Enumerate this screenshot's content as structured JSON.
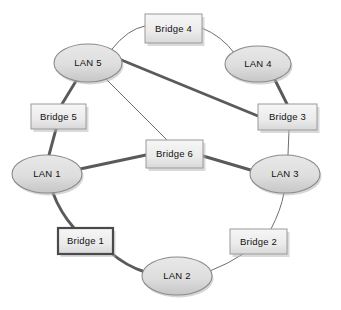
{
  "diagram": {
    "type": "network-topology",
    "colors": {
      "background": "#ffffff",
      "node_fill_light": "#e2e2e2",
      "node_fill_dark": "#c9c9c9",
      "node_stroke": "#8a8a8a",
      "box_fill_light": "#f2f2f2",
      "box_fill_dark": "#dcdcdc",
      "box_stroke": "#9a9a9a",
      "box_stroke_highlight": "#4a4a4a",
      "edge_thick": "#5a5a5a",
      "edge_thin": "#6e6e6e",
      "label_text": "#111111",
      "shadow": "#b5b5b5"
    },
    "lans": [
      {
        "id": "lan1",
        "label": "LAN 1",
        "cx": 47,
        "cy": 174,
        "rx": 35,
        "ry": 19
      },
      {
        "id": "lan2",
        "label": "LAN 2",
        "cx": 177,
        "cy": 276,
        "rx": 35,
        "ry": 19
      },
      {
        "id": "lan3",
        "label": "LAN 3",
        "cx": 285,
        "cy": 174,
        "rx": 35,
        "ry": 19
      },
      {
        "id": "lan4",
        "label": "LAN 4",
        "cx": 258,
        "cy": 64,
        "rx": 33,
        "ry": 18
      },
      {
        "id": "lan5",
        "label": "LAN 5",
        "cx": 88,
        "cy": 63,
        "rx": 34,
        "ry": 19
      }
    ],
    "bridges": [
      {
        "id": "bridge1",
        "label": "Bridge 1",
        "x": 58,
        "y": 228,
        "w": 55,
        "h": 26,
        "highlighted": true
      },
      {
        "id": "bridge2",
        "label": "Bridge 2",
        "x": 230,
        "y": 229,
        "w": 57,
        "h": 25,
        "highlighted": false
      },
      {
        "id": "bridge3",
        "label": "Bridge 3",
        "x": 258,
        "y": 104,
        "w": 59,
        "h": 26,
        "highlighted": false
      },
      {
        "id": "bridge4",
        "label": "Bridge 4",
        "x": 145,
        "y": 14,
        "w": 57,
        "h": 29,
        "highlighted": false
      },
      {
        "id": "bridge5",
        "label": "Bridge 5",
        "x": 31,
        "y": 104,
        "w": 55,
        "h": 25,
        "highlighted": false
      },
      {
        "id": "bridge6",
        "label": "Bridge 6",
        "x": 146,
        "y": 140,
        "w": 57,
        "h": 28,
        "highlighted": false
      }
    ],
    "links": [
      {
        "id": "lan5-bridge4",
        "from": "LAN 5",
        "to": "Bridge 4",
        "weight": "thin",
        "path": "M 112,49 Q 128,29 145,26"
      },
      {
        "id": "bridge4-lan4",
        "from": "Bridge 4",
        "to": "LAN 4",
        "weight": "thin",
        "path": "M 202,28 Q 222,36 235,54"
      },
      {
        "id": "lan5-bridge5",
        "from": "LAN 5",
        "to": "Bridge 5",
        "weight": "thick",
        "path": "M 76,81 L 62,104"
      },
      {
        "id": "bridge5-lan1",
        "from": "Bridge 5",
        "to": "LAN 1",
        "weight": "thick",
        "path": "M 56,129 L 49,155"
      },
      {
        "id": "lan5-bridge3",
        "from": "LAN 5",
        "to": "Bridge 3",
        "weight": "thick",
        "path": "M 119,59 L 258,116"
      },
      {
        "id": "lan4-bridge3",
        "from": "LAN 4",
        "to": "Bridge 3",
        "weight": "thick",
        "path": "M 275,80 L 287,104"
      },
      {
        "id": "bridge3-lan3",
        "from": "Bridge 3",
        "to": "LAN 3",
        "weight": "thin",
        "path": "M 289,130 L 288,155"
      },
      {
        "id": "lan5-bridge6",
        "from": "LAN 5",
        "to": "Bridge 6",
        "weight": "thin",
        "path": "M 104,77 L 167,140"
      },
      {
        "id": "lan1-bridge6",
        "from": "LAN 1",
        "to": "Bridge 6",
        "weight": "thick",
        "path": "M 80,169 L 146,155"
      },
      {
        "id": "bridge6-lan3",
        "from": "Bridge 6",
        "to": "LAN 3",
        "weight": "thick",
        "path": "M 203,156 L 254,171"
      },
      {
        "id": "lan1-bridge1",
        "from": "LAN 1",
        "to": "Bridge 1",
        "weight": "thick",
        "path": "M 53,193 Q 60,212 74,228"
      },
      {
        "id": "bridge1-lan2",
        "from": "Bridge 1",
        "to": "LAN 2",
        "weight": "thick",
        "path": "M 110,252 Q 126,266 145,272"
      },
      {
        "id": "lan2-bridge2",
        "from": "LAN 2",
        "to": "Bridge 2",
        "weight": "thin",
        "path": "M 210,271 Q 228,264 243,254"
      },
      {
        "id": "bridge2-lan3",
        "from": "Bridge 2",
        "to": "LAN 3",
        "weight": "thin",
        "path": "M 271,229 Q 281,210 284,193"
      }
    ]
  }
}
